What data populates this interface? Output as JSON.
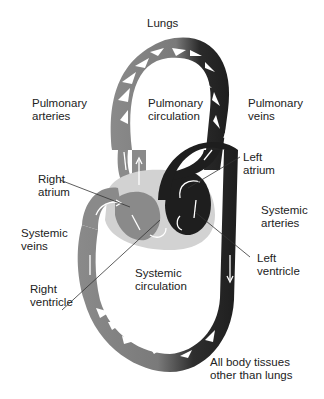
{
  "diagram": {
    "colors": {
      "deoxygenated": "#8a8a8a",
      "oxygenated": "#1e1e1e",
      "heart_tissue": "#cfcfcf",
      "background": "#ffffff",
      "arrow": "#ffffff"
    },
    "labels": {
      "lungs": "Lungs",
      "pulmonary_arteries": "Pulmonary\narteries",
      "pulmonary_circulation": "Pulmonary\ncirculation",
      "pulmonary_veins": "Pulmonary\nveins",
      "left_atrium": "Left\natrium",
      "right_atrium": "Right\natrium",
      "systemic_arteries": "Systemic\narteries",
      "systemic_veins": "Systemic\nveins",
      "left_ventricle": "Left\nventricle",
      "right_ventricle": "Right\nventricle",
      "systemic_circulation": "Systemic\ncirculation",
      "body_tissues": "All body tissues\nother than lungs"
    }
  }
}
